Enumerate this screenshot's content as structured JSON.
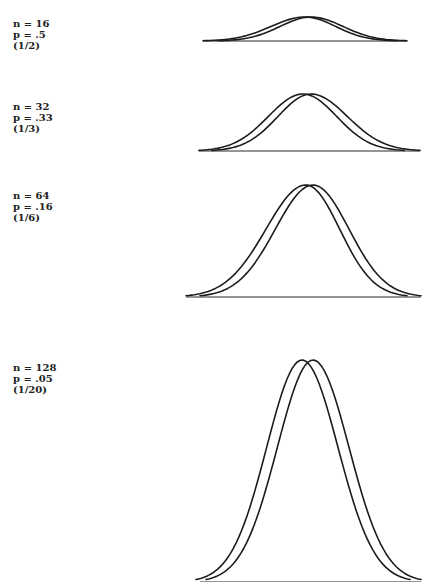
{
  "chart_data": [
    {
      "type": "line",
      "title": "",
      "labels": [
        "n = 16",
        "p = .5",
        "(1/2)"
      ],
      "n": 16,
      "p": 0.5,
      "fraction": "1/2",
      "series": [
        {
          "name": "distribution A",
          "shape": "bell",
          "peak_x_px": 305,
          "left_px": 203,
          "right_px": 397
        },
        {
          "name": "distribution B",
          "shape": "bell",
          "peak_x_px": 311,
          "left_px": 218,
          "right_px": 407
        }
      ],
      "layout": {
        "baseline_y": 41,
        "peak_y": 17,
        "baseline_x": [
          203,
          407
        ],
        "grid": false,
        "axes_ticks": false
      }
    },
    {
      "type": "line",
      "title": "",
      "labels": [
        "n = 32",
        "p = .33",
        "(1/3)"
      ],
      "n": 32,
      "p": 0.33,
      "fraction": "1/3",
      "series": [
        {
          "name": "distribution A",
          "shape": "bell",
          "peak_x_px": 303,
          "left_px": 199,
          "right_px": 404
        },
        {
          "name": "distribution B",
          "shape": "bell",
          "peak_x_px": 311,
          "left_px": 212,
          "right_px": 420
        }
      ],
      "layout": {
        "baseline_y": 151,
        "peak_y": 94,
        "baseline_x": [
          199,
          420
        ],
        "grid": false,
        "axes_ticks": false
      }
    },
    {
      "type": "line",
      "title": "",
      "labels": [
        "n = 64",
        "p = .16",
        "(1/6)"
      ],
      "n": 64,
      "p": 0.16,
      "fraction": "1/6",
      "series": [
        {
          "name": "distribution A",
          "shape": "bell",
          "peak_x_px": 306,
          "left_px": 186,
          "right_px": 407
        },
        {
          "name": "distribution B",
          "shape": "bell",
          "peak_x_px": 313,
          "left_px": 200,
          "right_px": 421
        }
      ],
      "layout": {
        "baseline_y": 297,
        "peak_y": 185,
        "baseline_x": [
          186,
          421
        ],
        "grid": false,
        "axes_ticks": false
      }
    },
    {
      "type": "line",
      "title": "",
      "labels": [
        "n = 128",
        "p = .05",
        "(1/20)"
      ],
      "n": 128,
      "p": 0.05,
      "fraction": "1/20",
      "series": [
        {
          "name": "distribution A",
          "shape": "bell",
          "peak_x_px": 302,
          "left_px": 196,
          "right_px": 410
        },
        {
          "name": "distribution B",
          "shape": "bell",
          "peak_x_px": 313,
          "left_px": 206,
          "right_px": 421
        }
      ],
      "layout": {
        "baseline_y": 582,
        "peak_y": 360,
        "baseline_x": [
          200,
          421
        ],
        "grid": false,
        "axes_ticks": false,
        "clipped_bottom": true
      }
    }
  ],
  "panels": [
    {
      "n_label": "n = 16",
      "p_label": "p = .5",
      "fraction_label": "(1/2)",
      "label_top": 18
    },
    {
      "n_label": "n = 32",
      "p_label": "p = .33",
      "fraction_label": "(1/3)",
      "label_top": 101
    },
    {
      "n_label": "n = 64",
      "p_label": "p = .16",
      "fraction_label": "(1/6)",
      "label_top": 190
    },
    {
      "n_label": "n = 128",
      "p_label": "p = .05",
      "fraction_label": "(1/20)",
      "label_top": 362
    }
  ],
  "colors": {
    "line": "#1c1c1c",
    "text": "#222222",
    "background": "#ffffff"
  }
}
